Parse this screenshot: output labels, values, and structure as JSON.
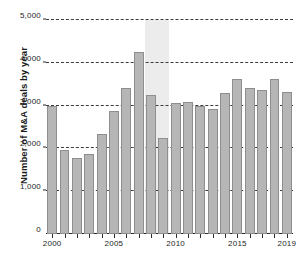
{
  "chart_data": {
    "type": "bar",
    "title": "",
    "subtitle": "",
    "xlabel": "",
    "ylabel": "Number of M&A deals by year",
    "categories": [
      "2000",
      "2001",
      "2002",
      "2003",
      "2004",
      "2005",
      "2006",
      "2007",
      "2008",
      "2009",
      "2010",
      "2011",
      "2012",
      "2013",
      "2014",
      "2015",
      "2016",
      "2017",
      "2018",
      "2019"
    ],
    "values": [
      2990,
      1960,
      1780,
      1860,
      2340,
      2880,
      3400,
      4250,
      3250,
      2250,
      3060,
      3080,
      3000,
      2920,
      3290,
      3620,
      3400,
      3360,
      3620,
      3310
    ],
    "series": [
      {
        "name": "Number of M&A deals by year",
        "values": [
          2990,
          1960,
          1780,
          1860,
          2340,
          2880,
          3400,
          4250,
          3250,
          2250,
          3060,
          3080,
          3000,
          2920,
          3290,
          3620,
          3400,
          3360,
          3620,
          3310
        ]
      }
    ],
    "ylim": [
      0,
      5000
    ],
    "ytick_values": [
      0,
      1000,
      2000,
      3000,
      4000,
      5000
    ],
    "ytick_labels": [
      "0",
      "1,000",
      "2,000",
      "3,000",
      "4,000",
      "5,000"
    ],
    "xtick_labels": [
      "2000",
      "2005",
      "2010",
      "2015",
      "2019"
    ],
    "xtick_categories": [
      "2000",
      "2005",
      "2010",
      "2015",
      "2019"
    ],
    "grid": "horizontal-dashed",
    "legend": "none",
    "bar_color": "#b6b6b6",
    "bar_border_color": "#8e8e8e",
    "grid_color": "#2b2b2b",
    "axis_color": "#2b2b2b",
    "background_color": "#ffffff",
    "annotations": [
      {
        "type": "shaded-band",
        "label": "",
        "start_category": "2008",
        "end_category": "2009",
        "color": "#ececed"
      }
    ]
  }
}
